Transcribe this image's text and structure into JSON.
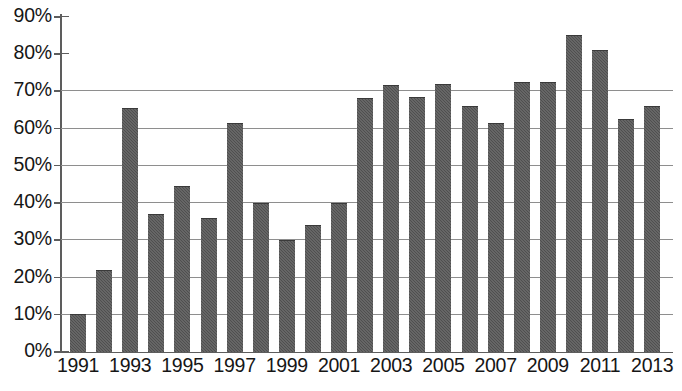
{
  "chart_data": {
    "type": "bar",
    "title": "",
    "xlabel": "",
    "ylabel": "",
    "categories": [
      "1991",
      "1992",
      "1993",
      "1994",
      "1995",
      "1996",
      "1997",
      "1998",
      "1999",
      "2000",
      "2001",
      "2002",
      "2003",
      "2004",
      "2005",
      "2006",
      "2007",
      "2008",
      "2009",
      "2010",
      "2011",
      "2012",
      "2013"
    ],
    "values": [
      10,
      22,
      65.5,
      37,
      44.5,
      36,
      61.5,
      40,
      30,
      34,
      40,
      68,
      71.5,
      68.5,
      72,
      66,
      61.5,
      72.5,
      72.5,
      85,
      81,
      62.5,
      66
    ],
    "ylim": [
      0,
      90
    ],
    "ytick_values": [
      0,
      10,
      20,
      30,
      40,
      50,
      60,
      70,
      80,
      90
    ],
    "ytick_labels": [
      "0%",
      "10%",
      "20%",
      "30%",
      "40%",
      "50%",
      "60%",
      "70%",
      "80%",
      "90%"
    ],
    "xtick_labels": [
      "1991",
      "",
      "1993",
      "",
      "1995",
      "",
      "1997",
      "",
      "1999",
      "",
      "2001",
      "",
      "2003",
      "",
      "2005",
      "",
      "2007",
      "",
      "2009",
      "",
      "2011",
      "",
      "2013"
    ],
    "grid": true,
    "gridline_values": [
      10,
      20,
      30,
      40,
      50,
      60,
      70
    ],
    "legend": null,
    "legend_position": "none",
    "series_color": "#4f4f4f",
    "axis_color": "#5d5d5d",
    "grid_color": "#8e8e8e",
    "text_color": "#161616"
  }
}
